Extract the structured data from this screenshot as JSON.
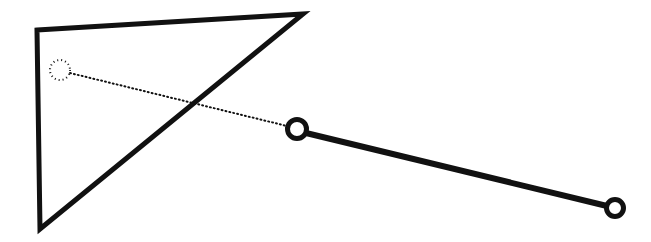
{
  "figure": {
    "type": "line-art-diagram",
    "background_color": "#ffffff",
    "ink_color": "#111111",
    "width": 651,
    "height": 242
  },
  "shapes": {
    "triangle": {
      "name": "triangle-outline",
      "stroke_color": "#111111",
      "stroke_width": 5,
      "fill": "none",
      "closed": true,
      "points": [
        {
          "label": "top-left",
          "x": 37,
          "y": 30
        },
        {
          "label": "top-right-apex",
          "x": 303,
          "y": 14
        },
        {
          "label": "bottom-left",
          "x": 40,
          "y": 229
        }
      ]
    },
    "dotted_circle": {
      "name": "dotted-node",
      "cx": 60,
      "cy": 70,
      "r": 10,
      "stroke_color": "#111111",
      "stroke_width": 2,
      "dash": "1 3",
      "fill": "none"
    },
    "solid_circle_middle": {
      "name": "middle-node",
      "cx": 297,
      "cy": 129,
      "r": 9.5,
      "stroke_color": "#111111",
      "stroke_width": 5,
      "fill": "#ffffff"
    },
    "solid_circle_right": {
      "name": "right-node",
      "cx": 615,
      "cy": 208,
      "r": 8.5,
      "stroke_color": "#111111",
      "stroke_width": 5,
      "fill": "#ffffff"
    },
    "dotted_link": {
      "name": "dotted-connector",
      "x1": 70,
      "y1": 73,
      "x2": 287,
      "y2": 126,
      "stroke_color": "#111111",
      "stroke_width": 2,
      "dash": "1 3"
    },
    "solid_link": {
      "name": "solid-connector",
      "x1": 306,
      "y1": 133,
      "x2": 607,
      "y2": 206,
      "stroke_color": "#111111",
      "stroke_width": 6
    }
  }
}
